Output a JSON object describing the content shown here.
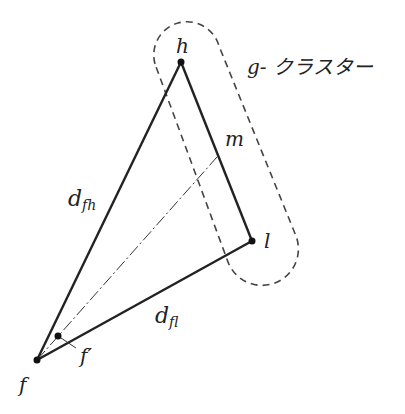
{
  "diagram": {
    "points": {
      "h": {
        "label": "h",
        "x": 181,
        "y": 62
      },
      "l": {
        "label": "l",
        "x": 252,
        "y": 241
      },
      "f": {
        "label": "f",
        "x": 37,
        "y": 360
      },
      "f_prime": {
        "label": "f′",
        "x": 58,
        "y": 336
      },
      "m": {
        "label": "m"
      }
    },
    "edge_labels": {
      "d_fh": {
        "main": "d",
        "sub": "fh"
      },
      "d_fl": {
        "main": "d",
        "sub": "fl"
      }
    },
    "cluster_label": "g- クラスター",
    "colors": {
      "line": "#222222",
      "dashed": "#444444"
    }
  }
}
